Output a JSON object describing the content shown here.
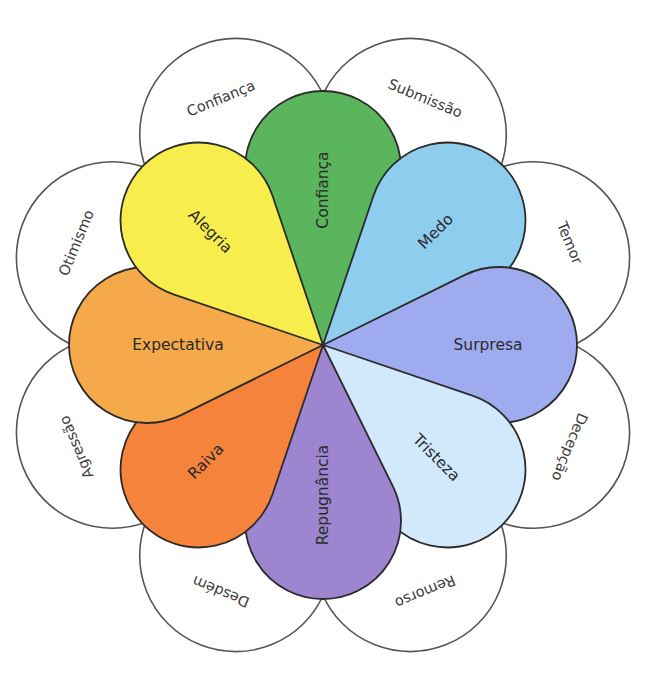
{
  "diagram": {
    "center": {
      "x": 323,
      "y": 345
    },
    "petal_geometry": {
      "head_distance": 176,
      "head_radius": 78
    },
    "outer_geometry": {
      "distance": 228,
      "radius": 96
    },
    "primary_emotions": [
      {
        "label": "Confiança",
        "angle": -90,
        "color": "#5ab55c",
        "label_rotation": -90,
        "label_distance": 155
      },
      {
        "label": "Medo",
        "angle": -45,
        "color": "#8fcdef",
        "label_rotation": -45,
        "label_distance": 160
      },
      {
        "label": "Surpresa",
        "angle": 0,
        "color": "#9eacef",
        "label_rotation": 0,
        "label_distance": 165
      },
      {
        "label": "Tristeza",
        "angle": 45,
        "color": "#d2e8fb",
        "label_rotation": 45,
        "label_distance": 160
      },
      {
        "label": "Repugnância",
        "angle": 90,
        "color": "#9d86cf",
        "label_rotation": -90,
        "label_distance": 150
      },
      {
        "label": "Raiva",
        "angle": 135,
        "color": "#f5833b",
        "label_rotation": -45,
        "label_distance": 165
      },
      {
        "label": "Expectativa",
        "angle": 180,
        "color": "#f6a94b",
        "label_rotation": 0,
        "label_distance": 145
      },
      {
        "label": "Alegria",
        "angle": -135,
        "color": "#f7ee4d",
        "label_rotation": 45,
        "label_distance": 160
      }
    ],
    "secondary_emotions": [
      {
        "label": "Confiança",
        "angle": -112.5,
        "label_rotation": -22.5
      },
      {
        "label": "Submissão",
        "angle": -67.5,
        "label_rotation": 22.5
      },
      {
        "label": "Temor",
        "angle": -22.5,
        "label_rotation": 67.5
      },
      {
        "label": "Decepção",
        "angle": 22.5,
        "label_rotation": 112.5
      },
      {
        "label": "Remorso",
        "angle": 67.5,
        "label_rotation": 157.5
      },
      {
        "label": "Desdém",
        "angle": 112.5,
        "label_rotation": -157.5
      },
      {
        "label": "Agressão",
        "angle": 157.5,
        "label_rotation": -112.5
      },
      {
        "label": "Otimismo",
        "angle": -157.5,
        "label_rotation": -67.5
      }
    ]
  }
}
